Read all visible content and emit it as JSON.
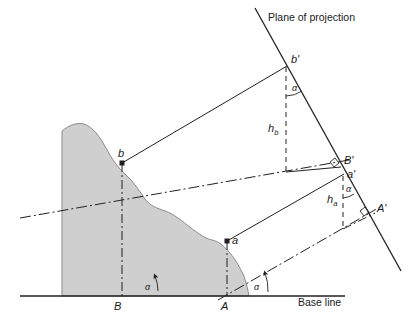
{
  "figure": {
    "type": "engineering-diagram",
    "width": 416,
    "height": 323,
    "background_color": "#ffffff",
    "line_color": "#231f20",
    "terrain_fill_color": "#cfcfcf",
    "terrain_stroke_color": "#8c8c8c"
  },
  "labels": {
    "plane_of_projection": "Plane of projection",
    "base_line": "Base line",
    "point_b_prime": "b'",
    "point_b": "b",
    "point_B_prime": "B'",
    "point_B": "B",
    "point_a_prime": "a'",
    "point_a": "a",
    "point_A_prime": "A'",
    "point_A": "A",
    "height_b": "h",
    "height_b_sub": "b",
    "height_a": "h",
    "height_a_sub": "a",
    "angle_alpha": "α"
  },
  "angles": [
    {
      "name": "alpha-at-b-prime",
      "label": "α",
      "x": 293,
      "y": 89
    },
    {
      "name": "alpha-at-a-prime",
      "label": "α",
      "x": 347,
      "y": 190
    },
    {
      "name": "alpha-at-B",
      "label": "α",
      "x": 148,
      "y": 285
    },
    {
      "name": "alpha-at-A",
      "label": "α",
      "x": 256,
      "y": 285
    }
  ],
  "points": [
    {
      "name": "b-prime",
      "label": "b'",
      "x": 286,
      "y": 67,
      "marker": false
    },
    {
      "name": "b",
      "label": "b",
      "x": 122,
      "y": 163,
      "marker": true
    },
    {
      "name": "B-prime",
      "label": "B'",
      "x": 340,
      "y": 165,
      "marker": false
    },
    {
      "name": "a-prime",
      "label": "a'",
      "x": 343,
      "y": 175,
      "marker": false
    },
    {
      "name": "A-prime",
      "label": "A'",
      "x": 372,
      "y": 212,
      "marker": false
    },
    {
      "name": "a",
      "label": "a",
      "x": 227,
      "y": 241,
      "marker": true
    },
    {
      "name": "B",
      "label": "B",
      "x": 118,
      "y": 296,
      "marker": false
    },
    {
      "name": "A",
      "label": "A",
      "x": 225,
      "y": 296,
      "marker": false
    }
  ],
  "lines": {
    "plane_of_projection": {
      "x1": 255,
      "y1": 8,
      "x2": 401,
      "y2": 271,
      "style": "solid"
    },
    "base_line": {
      "x1": 20,
      "y1": 296,
      "x2": 345,
      "y2": 296,
      "style": "solid"
    },
    "ray_b_to_bprime": {
      "x1": 122,
      "y1": 163,
      "x2": 286,
      "y2": 67,
      "style": "solid"
    },
    "height_b_drop": {
      "x1": 286,
      "y1": 67,
      "x2": 286,
      "y2": 170,
      "style": "dashed"
    },
    "height_a_drop": {
      "x1": 343,
      "y1": 175,
      "x2": 343,
      "y2": 227,
      "style": "dashed"
    },
    "b_vertical": {
      "x1": 122,
      "y1": 163,
      "x2": 122,
      "y2": 296,
      "style": "dash-dot"
    },
    "a_vertical": {
      "x1": 227,
      "y1": 241,
      "x2": 227,
      "y2": 296,
      "style": "dash-dot"
    },
    "ray_B_to_Bprime": {
      "x1": 118,
      "y1": 296,
      "x2": 340,
      "y2": 165,
      "style": "dash-dot"
    },
    "ray_A_to_Aprime": {
      "x1": 225,
      "y1": 296,
      "x2": 372,
      "y2": 212,
      "style": "dash-dot"
    },
    "ray_a_to_aprime": {
      "x1": 227,
      "y1": 241,
      "x2": 343,
      "y2": 175,
      "style": "solid"
    },
    "connector_bprime_Bprime": {
      "x1": 286,
      "y1": 170,
      "x2": 340,
      "y2": 165,
      "style": "solid"
    },
    "connector_aprime_Aprime": {
      "x1": 343,
      "y1": 227,
      "x2": 372,
      "y2": 212,
      "style": "dash-dot"
    }
  },
  "text_positions": {
    "plane_of_projection": {
      "x": 268,
      "y": 12
    },
    "base_line": {
      "x": 298,
      "y": 298
    },
    "h_b": {
      "x": 271,
      "y": 126
    },
    "h_a": {
      "x": 330,
      "y": 197
    }
  }
}
